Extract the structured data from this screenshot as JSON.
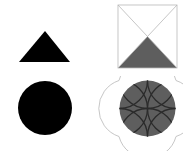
{
  "canvas": {
    "width": 183,
    "height": 151,
    "background": "#ffffff",
    "layout": "2x2-grid",
    "title": "Geometric Shapes Grid"
  },
  "palette": {
    "black": "#000000",
    "gray_fill": "#5e5e5e",
    "dark_arc": "#2b2b2b",
    "light_outline": "#b8b8b8",
    "background": "#ffffff"
  },
  "figures": [
    {
      "id": "triangle-solid",
      "name": "solid-black-triangle",
      "shape": "triangle",
      "fill": "#000000",
      "stroke": "none",
      "position": "top-left",
      "points": "45,31 70,62 19,62",
      "bbox": {
        "x": 19,
        "y": 31,
        "width": 51,
        "height": 31
      }
    },
    {
      "id": "square-diagonals",
      "name": "square-with-diagonals-and-gray-triangle",
      "shape": "square",
      "fill": "none",
      "stroke": "#b8b8b8",
      "stroke_width": 0.8,
      "position": "top-right",
      "bbox": {
        "x": 26,
        "y": 5,
        "width": 59,
        "height": 63
      },
      "diagonals": [
        "26,5 85,68",
        "85,5 26,68"
      ],
      "inner_triangle": {
        "name": "gray-bottom-triangle",
        "points": "26,68 85,68 55.5,36.5",
        "fill": "#5e5e5e"
      }
    },
    {
      "id": "circle-solid",
      "name": "solid-black-circle",
      "shape": "circle",
      "fill": "#000000",
      "stroke": "none",
      "position": "bottom-left",
      "cx": 45,
      "cy": 32,
      "r": 27
    },
    {
      "id": "circle-arcs",
      "name": "gray-circle-with-crossing-arcs",
      "shape": "circle",
      "fill": "#5e5e5e",
      "stroke": "none",
      "position": "bottom-right",
      "cx": 55.5,
      "cy": 32.5,
      "r": 28,
      "petal_arc_radius": 29.5,
      "petal_outline_stroke": "#b8b8b8",
      "inner_arc_stroke": "#2b2b2b",
      "inner_arc_count": 8,
      "petal_arc_count": 4
    }
  ]
}
